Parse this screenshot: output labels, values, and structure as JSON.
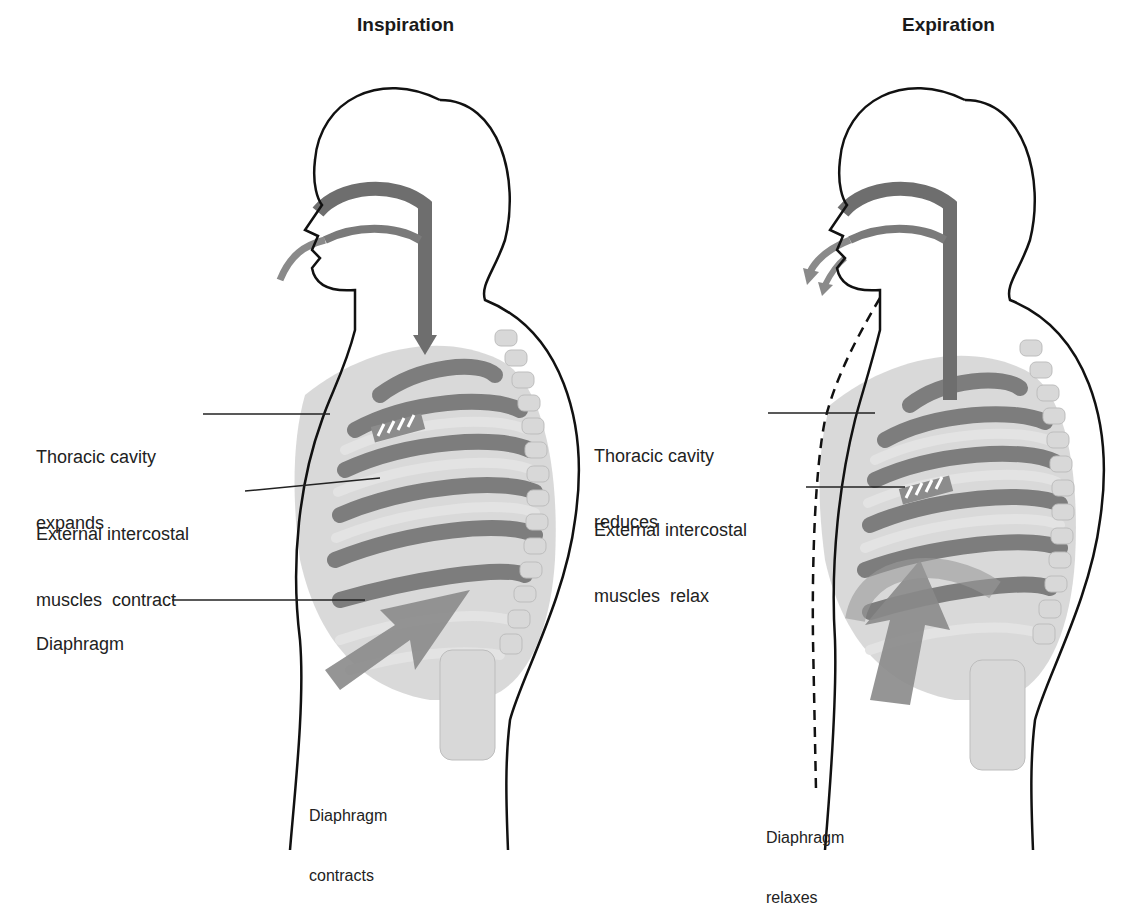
{
  "diagram": {
    "panels": [
      {
        "title": "Inspiration",
        "labels": {
          "thoracic_1": "Thoracic cavity",
          "thoracic_2": "expands",
          "intercostal_1": "External intercostal",
          "intercostal_2": "muscles  contract",
          "diaphragm": "Diaphragm",
          "diaphragm_action_1": "Diaphragm",
          "diaphragm_action_2": "contracts"
        },
        "arrow_direction": "down"
      },
      {
        "title": "Expiration",
        "labels": {
          "thoracic_1": "Thoracic cavity",
          "thoracic_2": "reduces",
          "intercostal_1": "External intercostal",
          "intercostal_2": "muscles  relax",
          "diaphragm_action_1": "Diaphragm",
          "diaphragm_action_2": "relaxes"
        },
        "arrow_direction": "up"
      }
    ],
    "colors": {
      "outline": "#111111",
      "airway": "#6e6e6e",
      "ribs": "#c9c9c9",
      "lung": "#7d7d7d",
      "arrow": "#8a8a8a"
    }
  }
}
